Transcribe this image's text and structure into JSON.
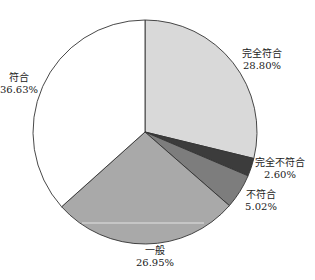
{
  "chart_data": {
    "type": "pie",
    "title": "",
    "categories": [
      "完全符合",
      "完全不符合",
      "不符合",
      "一般",
      "符合"
    ],
    "values": [
      28.8,
      2.6,
      5.02,
      26.95,
      36.63
    ],
    "value_labels": [
      "28.80%",
      "2.60%",
      "5.02%",
      "26.95%",
      "36.63%"
    ],
    "colors": [
      "#d9d9d9",
      "#3c3c3c",
      "#7d7d7d",
      "#a9a9a9",
      "#ffffff"
    ],
    "start_angle": "12 o'clock",
    "direction": "clockwise",
    "legend": "none (labels outside slices)"
  },
  "labels": {
    "s0": {
      "name": "完全符合",
      "pct": "28.80%"
    },
    "s1": {
      "name": "完全不符合",
      "pct": "2.60%"
    },
    "s2": {
      "name": "不符合",
      "pct": "5.02%"
    },
    "s3": {
      "name": "一般",
      "pct": "26.95%"
    },
    "s4": {
      "name": "符合",
      "pct": "36.63%"
    }
  }
}
